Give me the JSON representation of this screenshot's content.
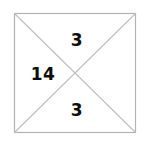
{
  "figure": {
    "type": "square-with-diagonals",
    "colors": {
      "background": "#ffffff",
      "outline": "#b3b3b3",
      "diagonal": "#bfbfbf",
      "label_text": "#0d0d0d"
    },
    "square": {
      "x": 14,
      "y": 13,
      "width": 122,
      "height": 120,
      "stroke_width": 1
    },
    "diagonals": [
      {
        "name": "diagonal-top-left-to-bottom-right",
        "x1": 14,
        "y1": 13,
        "x2": 136,
        "y2": 133
      },
      {
        "name": "diagonal-top-right-to-bottom-left",
        "x1": 136,
        "y1": 13,
        "x2": 14,
        "y2": 133
      }
    ],
    "center": {
      "x": 75,
      "y": 73
    },
    "labels": {
      "top": "3",
      "left": "14",
      "bottom": "3"
    }
  }
}
